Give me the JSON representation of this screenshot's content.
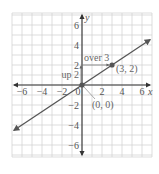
{
  "chart_data": {
    "type": "line",
    "title": "",
    "xlabel": "x",
    "ylabel": "y",
    "xlim": [
      -7,
      7
    ],
    "ylim": [
      -7.2,
      7.2
    ],
    "grid": true,
    "x_ticks": [
      -6,
      -4,
      -2,
      0,
      2,
      4,
      6
    ],
    "x_tick_labels": [
      "−6",
      "−4",
      "−2",
      "0",
      "2",
      "4",
      "6"
    ],
    "y_ticks": [
      -6,
      -4,
      -2,
      2,
      4,
      6
    ],
    "y_tick_labels": [
      "−6",
      "−4",
      "−2",
      "2",
      "4",
      "6"
    ],
    "series": [
      {
        "name": "y = (2/3)x",
        "x": [
          -6.8,
          6.8
        ],
        "y": [
          -4.53,
          4.53
        ],
        "arrows_both_ends": true
      }
    ],
    "points": [
      {
        "x": 0,
        "y": 0,
        "label": "(0, 0)"
      },
      {
        "x": 3,
        "y": 2,
        "label": "(3, 2)"
      }
    ],
    "annotations": [
      {
        "text": "up 2",
        "from": [
          0,
          0
        ],
        "to": [
          0,
          2
        ],
        "direction": "vertical"
      },
      {
        "text": "over 3",
        "from": [
          0,
          2
        ],
        "to": [
          3,
          2
        ],
        "direction": "horizontal"
      }
    ]
  },
  "colors": {
    "grid": "#cfcfcf",
    "axis": "#333333",
    "line": "#555555",
    "point": "#555555",
    "text": "#555555"
  }
}
